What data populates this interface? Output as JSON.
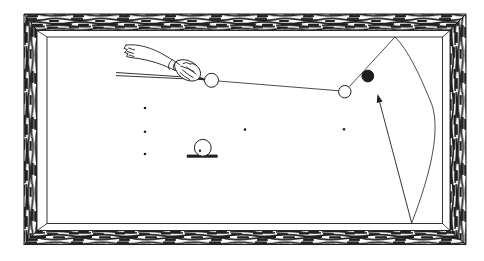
{
  "scene": {
    "canvas": {
      "width": 484,
      "height": 261
    },
    "colors": {
      "ink": "#1f1f1f",
      "paper": "#ffffff"
    },
    "frame": {
      "outer": [
        24,
        14,
        466,
        244.5
      ],
      "wood_inner": [
        37,
        30.5,
        450,
        230.5
      ],
      "play": [
        47,
        37,
        442.5,
        223.5
      ]
    },
    "balls": [
      {
        "id": "cue-ball",
        "cx": 211.5,
        "cy": 80.3,
        "r": 7,
        "filled": false
      },
      {
        "id": "object-ball",
        "cx": 344.8,
        "cy": 91.7,
        "r": 6.2,
        "filled": false
      },
      {
        "id": "target-black-ball",
        "cx": 367.8,
        "cy": 76,
        "r": 5.9,
        "filled": true
      }
    ],
    "spots": [
      [
        145,
        108
      ],
      [
        145,
        131.8
      ],
      [
        145,
        154
      ],
      [
        245,
        129.6
      ],
      [
        344,
        129.3
      ]
    ],
    "marker": {
      "ball": {
        "cx": 202.8,
        "cy": 147.8,
        "r": 8.4
      },
      "spot": [
        200,
        150.8
      ],
      "bar": {
        "x": 186.8,
        "y": 154.6,
        "w": 30.8,
        "h": 3.1
      }
    },
    "cue": {
      "lines": [
        "M116,72.5 L203,78.2",
        "M116,75.6 L203,79.6"
      ],
      "tip": [
        197,
        77.8,
        205,
        79.8
      ]
    },
    "arm": {
      "hand_fill": "M176,61.5 C181,58.5 187.5,59.5 192.5,62.5 C197.5,65.5 200.5,69.5 200.5,73.5 C200.5,78 197.5,81 192,81 C186,81 180.5,77.5 177.5,73 C174.5,68.5 173.5,64 176,61.5 Z",
      "strokes": [
        "M126,45 C138,43.5 153,48 165,55.5 C171,59 176,62 179.5,64.5",
        "M130.5,57.5 C142,58.5 154,61.5 164,65.5 C168,67.5 172.5,69 176,70.5",
        "M126,45 L124,48.5 L127.5,49.5 L124.5,52.5 L128,53.5 L126.5,56.5 L130.5,57.5",
        "M128.5,48 L134.5,50 M127.5,51.5 L133.5,53.5 M129,55 L134,56.5",
        "M172.5,59.5 C168.5,62.5 167.5,66.5 169.5,69.8",
        "M176.5,61.5 C173,64.5 172.5,67.8 174.5,70.5",
        "M183,63.5 Q186.5,61.5 189.5,63.5 M189.8,64 Q193,62.5 195.5,65",
        "M182.5,70 Q187.5,74.5 193,77.5 M186.5,67 Q191.5,71 196,74 M180,72.5 Q184.5,77 189.5,79.5",
        "M180.5,66 Q187.5,68 194,71.5"
      ]
    },
    "trajectory": {
      "lines": [
        [
          218,
          81,
          339.5,
          90.8
        ],
        [
          349.5,
          86.5,
          395,
          37
        ]
      ],
      "curve": "M395,37 C408,50 420,75 432,105 C440,130 432,170 411.7,223",
      "arrow": {
        "shaft": [
          411.7,
          223
        ],
        "tip": [
          377.5,
          94
        ],
        "head_len": 8.5,
        "head_w": 6
      }
    }
  }
}
